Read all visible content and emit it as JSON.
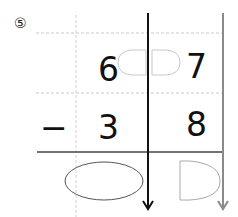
{
  "problem": {
    "label": "⑤",
    "operator": "−",
    "minuend": {
      "tens": "6",
      "ones": "7"
    },
    "subtrahend": {
      "tens": "3",
      "ones": "8"
    },
    "answer_boxes": [
      "oval-tens",
      "d-shape-ones"
    ],
    "borrow_box": "split-oval"
  },
  "colors": {
    "ink": "#111111",
    "grid": "#c8c8c8",
    "box_outline": "#555555",
    "light_box": "#bdbdbd",
    "arrow_gray": "#8a8a8a"
  }
}
